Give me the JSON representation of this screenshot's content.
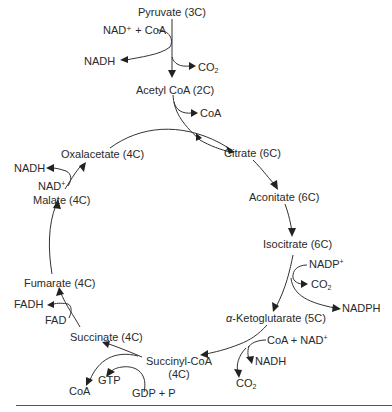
{
  "diagram": {
    "entry": {
      "pyruvate": "Pyruvate (3C)",
      "nad_coa_in": "NAD⁺ + CoA",
      "nadh_out": "NADH",
      "co2_out": "CO",
      "co2_sub": "2",
      "acetyl_coa": "Acetyl CoA (2C)",
      "coa_out": "CoA"
    },
    "cycle": {
      "citrate": "Citrate (6C)",
      "aconitate": "Aconitate (6C)",
      "isocitrate": "Isocitrate (6C)",
      "alpha": "α",
      "ketoglutarate": "-Ketoglutarate (5C)",
      "succinyl_coa_line1": "Succinyl-CoA",
      "succinyl_coa_line2": "(4C)",
      "succinate": "Succinate (4C)",
      "fumarate": "Fumarate (4C)",
      "malate": "Malate (4C)",
      "oxalacetate": "Oxalacetate (4C)"
    },
    "side": {
      "isocitrate_nadp_in": "NADP",
      "isocitrate_nadp_sup": "+",
      "isocitrate_co2": "CO",
      "isocitrate_co2_sub": "2",
      "isocitrate_nadph": "NADPH",
      "akg_in": "CoA + NAD",
      "akg_in_sup": "+",
      "akg_nadh": "NADH",
      "akg_co2": "CO",
      "akg_co2_sub": "2",
      "sc_gdp_in": "GDP + P",
      "sc_gtp": "GTP",
      "sc_coa": "CoA",
      "succ_fad_in": "FAD",
      "succ_fadh": "FADH",
      "malate_nad_in": "NAD",
      "malate_nad_sup": "+",
      "malate_nadh": "NADH"
    }
  }
}
